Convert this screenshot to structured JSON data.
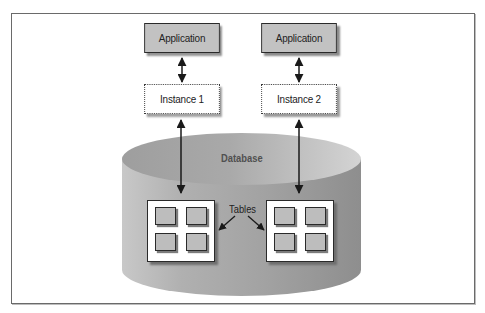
{
  "diagram": {
    "type": "client-server database architecture",
    "applications": [
      {
        "label": "Application",
        "connects_to": "Instance 1"
      },
      {
        "label": "Application",
        "connects_to": "Instance 2"
      }
    ],
    "instances": [
      {
        "label": "Instance 1",
        "style": "dotted"
      },
      {
        "label": "Instance 2",
        "style": "dotted"
      }
    ],
    "database": {
      "label": "Database",
      "shape": "cylinder",
      "table_groups": [
        {
          "tables": 4
        },
        {
          "tables": 4
        }
      ],
      "tables_label": "Tables"
    },
    "edges": [
      {
        "from": "Application (left)",
        "to": "Instance 1",
        "type": "bidirectional"
      },
      {
        "from": "Application (right)",
        "to": "Instance 2",
        "type": "bidirectional"
      },
      {
        "from": "Instance 1",
        "to": "Table group (left)",
        "type": "bidirectional"
      },
      {
        "from": "Instance 2",
        "to": "Table group (right)",
        "type": "bidirectional"
      },
      {
        "from": "Tables label",
        "to": "Table group (left)",
        "type": "pointer"
      },
      {
        "from": "Tables label",
        "to": "Table group (right)",
        "type": "pointer"
      }
    ],
    "colors": {
      "app_fill": "#c2c2c2",
      "cylinder_fill": "#a8a8a8",
      "cylinder_top": "#b5b5b5",
      "border": "#2a2a2a",
      "frame": "#6a6a6a"
    }
  }
}
